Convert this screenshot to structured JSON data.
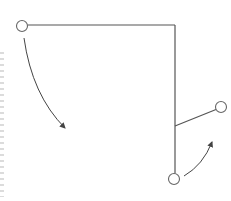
{
  "diagram": {
    "type": "tree-rotation",
    "colors": {
      "line": "#555555",
      "node_stroke": "#666666",
      "node_fill": "#ffffff",
      "arrow": "#444444",
      "background": "#ffffff"
    },
    "nodes": [
      {
        "id": "left-node",
        "cx": 22,
        "cy": 26,
        "r": 5.5
      },
      {
        "id": "right-node",
        "cx": 221,
        "cy": 107,
        "r": 5.5
      },
      {
        "id": "bottom-node",
        "cx": 174,
        "cy": 179,
        "r": 5.5
      }
    ],
    "edges": [
      {
        "id": "top-horizontal-edge",
        "x1": 27.5,
        "y1": 25,
        "x2": 175,
        "y2": 25
      },
      {
        "id": "vertical-edge",
        "x1": 175,
        "y1": 25,
        "x2": 175,
        "y2": 173.5
      },
      {
        "id": "branch-edge",
        "x1": 175,
        "y1": 126,
        "x2": 216,
        "y2": 109.5
      }
    ],
    "arrows": [
      {
        "id": "left-curved-arrow",
        "path": "M24 38 Q 32 95 65 128"
      },
      {
        "id": "right-curved-arrow",
        "path": "M184 176 Q 203 165 212 142"
      }
    ]
  }
}
